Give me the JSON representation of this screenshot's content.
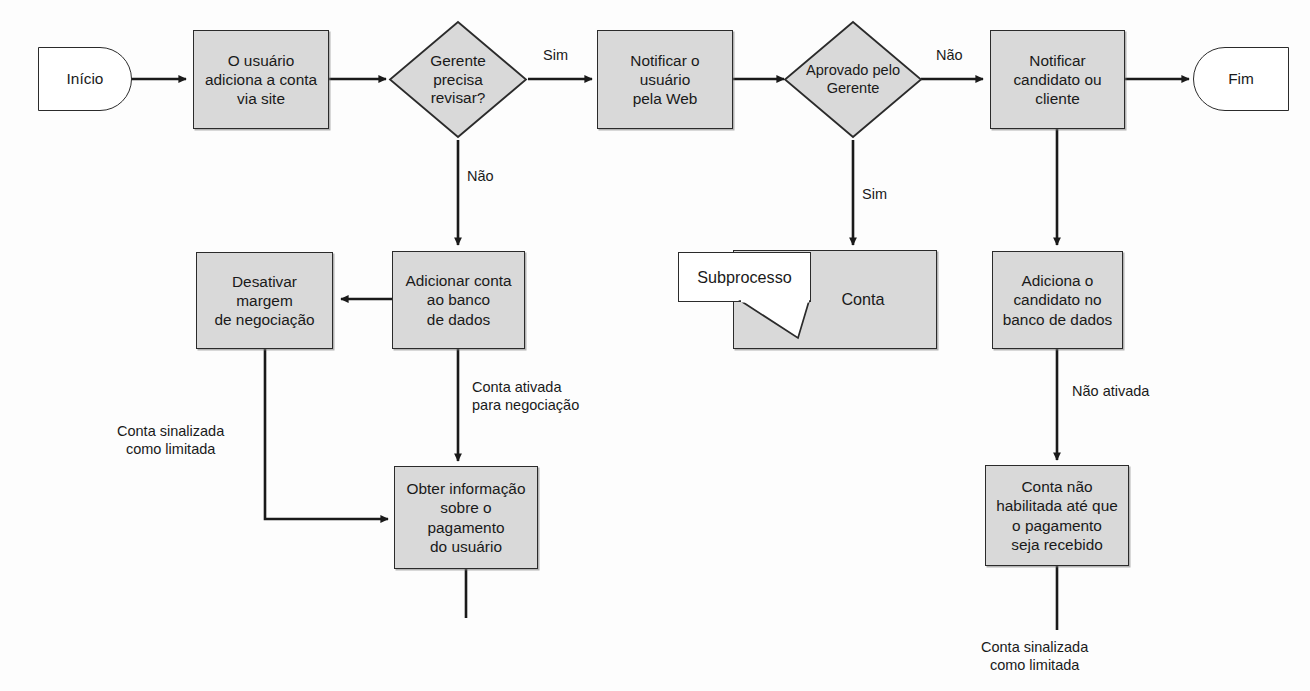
{
  "diagram": {
    "language": "pt-BR",
    "style": {
      "process_fill": "#d9d9d9",
      "terminator_fill": "#ffffff",
      "stroke": "#2b2b2b",
      "background": "#fdfdfd"
    }
  },
  "nodes": {
    "start": {
      "label": "Início",
      "shape": "terminator"
    },
    "add_account": {
      "label": "O usuário\nadiciona a conta\nvia site",
      "shape": "process"
    },
    "manager_review": {
      "label": "Gerente\nprecisa\nrevisar?",
      "shape": "decision"
    },
    "notify_web": {
      "label": "Notificar o\nusuário\npela Web",
      "shape": "process"
    },
    "approved": {
      "label": "Aprovado pelo\nGerente",
      "shape": "decision"
    },
    "notify_candidate": {
      "label": "Notificar\ncandidato ou\ncliente",
      "shape": "process"
    },
    "end": {
      "label": "Fim",
      "shape": "terminator"
    },
    "disable_margin": {
      "label": "Desativar\nmargem\nde negociação",
      "shape": "process"
    },
    "add_to_db": {
      "label": "Adicionar conta\nao banco\nde dados",
      "shape": "process"
    },
    "account_sub": {
      "label": "Conta",
      "shape": "process"
    },
    "subprocess_callout": {
      "label": "Subprocesso",
      "shape": "callout"
    },
    "add_candidate_db": {
      "label": "Adiciona o\ncandidato no\nbanco de dados",
      "shape": "process"
    },
    "get_payment_info": {
      "label": "Obter informação\nsobre o\npagamento\ndo usuário",
      "shape": "process"
    },
    "account_not_enabled": {
      "label": "Conta não\nhabilitada até que\no pagamento\nseja recebido",
      "shape": "process"
    }
  },
  "edge_labels": {
    "review_yes": "Sim",
    "review_no": "Não",
    "approved_no": "Não",
    "approved_yes": "Sim",
    "account_activated": "Conta ativada\npara negociação",
    "flagged_limited_left": "Conta sinalizada\ncomo limitada",
    "not_activated": "Não ativada",
    "flagged_limited_right": "Conta sinalizada\ncomo limitada"
  }
}
